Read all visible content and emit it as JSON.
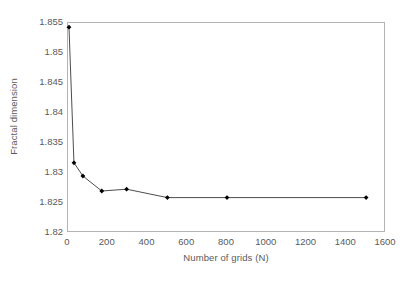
{
  "chart_data": {
    "type": "line",
    "title": "",
    "xlabel": "Number of grids (N)",
    "ylabel": "Fractal dimension",
    "xlim": [
      0,
      1600
    ],
    "ylim": [
      1.82,
      1.855
    ],
    "xticks": [
      0,
      200,
      400,
      600,
      800,
      1000,
      1200,
      1400,
      1600
    ],
    "xtick_labels": [
      "0",
      "200",
      "400",
      "600",
      "800",
      "1000",
      "1200",
      "1400",
      "1600"
    ],
    "yticks": [
      1.82,
      1.825,
      1.83,
      1.835,
      1.84,
      1.845,
      1.85,
      1.855
    ],
    "ytick_labels": [
      "1.82",
      "1.825",
      "1.83",
      "1.835",
      "1.84",
      "1.845",
      "1.85",
      "1.855"
    ],
    "grid": false,
    "legend": false,
    "series": [
      {
        "name": "Fractal dimension vs number of grids",
        "marker": "diamond",
        "color": "#000000",
        "line_color": "#4d4d4d",
        "x": [
          5,
          30,
          75,
          170,
          295,
          500,
          800,
          1500
        ],
        "y": [
          1.8543,
          1.8317,
          1.8295,
          1.827,
          1.8273,
          1.8259,
          1.8259,
          1.8259
        ]
      }
    ]
  }
}
